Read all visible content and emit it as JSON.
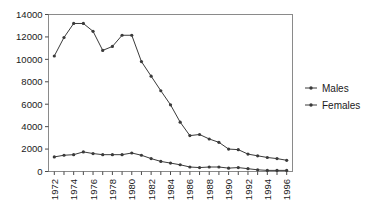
{
  "chart_data": {
    "type": "line",
    "title": "",
    "subtitle": "",
    "xlabel": "",
    "ylabel": "",
    "x": [
      1972,
      1973,
      1974,
      1975,
      1976,
      1977,
      1978,
      1979,
      1980,
      1981,
      1982,
      1983,
      1984,
      1985,
      1986,
      1987,
      1988,
      1989,
      1990,
      1991,
      1992,
      1993,
      1994,
      1995,
      1996
    ],
    "xlim": [
      1971.4,
      1996.6
    ],
    "ylim": [
      0,
      14000
    ],
    "yticks": [
      0,
      2000,
      4000,
      6000,
      8000,
      10000,
      12000,
      14000
    ],
    "ytick_labels": [
      "0",
      "2000",
      "4000",
      "6000",
      "8000",
      "10000",
      "12000",
      "14000"
    ],
    "xtick_labels": [
      "1972",
      "1974",
      "1976",
      "1978",
      "1980",
      "1982",
      "1984",
      "1986",
      "1988",
      "1990",
      "1992",
      "1994",
      "1996"
    ],
    "xtick_label_years": [
      1972,
      1974,
      1976,
      1978,
      1980,
      1982,
      1984,
      1986,
      1988,
      1990,
      1992,
      1994,
      1996
    ],
    "xtick_rotation": 90,
    "grid": false,
    "legend_position": "right",
    "series": [
      {
        "name": "Males",
        "color": "#3a3a3a",
        "marker": "dot",
        "values": [
          10300,
          11950,
          13200,
          13200,
          12500,
          10800,
          11150,
          12150,
          12150,
          9800,
          8500,
          7200,
          5950,
          4400,
          3200,
          3300,
          2900,
          2600,
          2000,
          1950,
          1550,
          1400,
          1250,
          1150,
          1000
        ]
      },
      {
        "name": "Females",
        "color": "#3a3a3a",
        "marker": "dot",
        "values": [
          1300,
          1450,
          1500,
          1750,
          1600,
          1500,
          1500,
          1500,
          1650,
          1450,
          1150,
          900,
          750,
          600,
          400,
          350,
          400,
          400,
          300,
          350,
          250,
          150,
          100,
          100,
          100
        ]
      }
    ]
  },
  "legend": {
    "items": [
      {
        "label": "Males"
      },
      {
        "label": "Females"
      }
    ]
  }
}
